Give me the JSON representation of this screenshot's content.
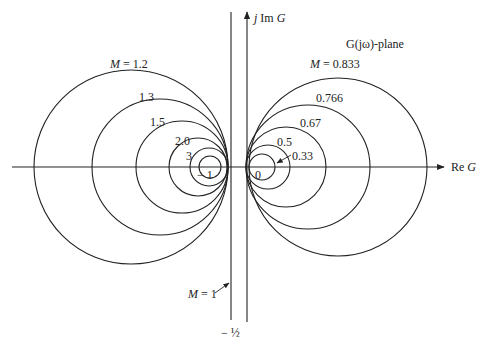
{
  "title": "G(jω)-plane",
  "axes": {
    "real_label": "Re G",
    "imag_label": "j Im G"
  },
  "m1_line": {
    "label": "M = 1",
    "position_label": "− ½",
    "x_value": -0.5
  },
  "origin_labels": {
    "minus_one": "− 1",
    "zero": "0"
  },
  "left_circles": [
    {
      "label": "M = 1.2",
      "M": 1.2,
      "cx": 131,
      "r": 97
    },
    {
      "label": "1.3",
      "M": 1.3,
      "cx": 160,
      "r": 68
    },
    {
      "label": "1.5",
      "M": 1.5,
      "cx": 182,
      "r": 46
    },
    {
      "label": "2.0",
      "M": 2.0,
      "cx": 198,
      "r": 29
    },
    {
      "label": "3",
      "M": 3,
      "cx": 209,
      "r": 19
    },
    {
      "label": "",
      "M": 5,
      "cx": 210,
      "r": 11
    }
  ],
  "right_circles": [
    {
      "label": "M = 0.833",
      "M": 0.833,
      "cx": 338,
      "r": 89
    },
    {
      "label": "0.766",
      "M": 0.766,
      "cx": 308,
      "r": 62
    },
    {
      "label": "0.67",
      "M": 0.67,
      "cx": 286,
      "r": 40
    },
    {
      "label": "0.5",
      "M": 0.5,
      "cx": 268,
      "r": 22
    },
    {
      "label": "0.33",
      "M": 0.33,
      "cx": 262,
      "r": 13
    }
  ],
  "colors": {
    "line": "#222222",
    "background": "#ffffff"
  },
  "chart_data": {
    "type": "diagram",
    "xlabel": "Re G",
    "ylabel": "j Im G",
    "M_values_left": [
      1.2,
      1.3,
      1.5,
      2.0,
      3
    ],
    "M_values_right": [
      0.833,
      0.766,
      0.67,
      0.5,
      0.33
    ],
    "M1_line_x": -0.5,
    "annotations": [
      "G(jω)-plane",
      "M = 1",
      "−1",
      "0",
      "−1/2"
    ]
  }
}
